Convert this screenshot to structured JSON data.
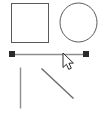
{
  "canvas": {
    "width": 103,
    "height": 115,
    "background_color": "#ffffff",
    "label": "drawing-canvas"
  },
  "style": {
    "shape_stroke_color": "#5a5a5a",
    "line_stroke_color": "#8e8e8e",
    "diagonal_stroke_color": "#6b6b6b",
    "handle_fill_color": "#2b2b2b",
    "handle_stroke_color": "#2b2b2b",
    "cursor_fill_color": "#ffffff",
    "cursor_stroke_color": "#2b2b2b",
    "shape_fill_color": "none",
    "shape_stroke_width": 1,
    "line_stroke_width": 1.4,
    "diagonal_stroke_width": 1.4
  },
  "shapes": [
    {
      "id": "square",
      "type": "rectangle",
      "name": "square-shape",
      "x": 11,
      "y": 3,
      "width": 37,
      "height": 39,
      "selected": false
    },
    {
      "id": "circle",
      "type": "ellipse",
      "name": "circle-shape",
      "cx": 78.5,
      "cy": 22.5,
      "rx": 18.5,
      "ry": 19.5,
      "selected": false
    },
    {
      "id": "horizontal-line",
      "type": "line",
      "name": "horizontal-line-shape",
      "x1": 12,
      "y1": 54,
      "x2": 86,
      "y2": 54,
      "selected": true
    },
    {
      "id": "vertical-line",
      "type": "line",
      "name": "vertical-line-shape",
      "x1": 20,
      "y1": 67,
      "x2": 20,
      "y2": 108,
      "selected": false
    },
    {
      "id": "diagonal-line",
      "type": "line",
      "name": "diagonal-line-shape",
      "x1": 41,
      "y1": 68,
      "x2": 73,
      "y2": 98,
      "selected": false
    }
  ],
  "selection_handles": [
    {
      "name": "selection-handle-left",
      "cx": 12,
      "cy": 54,
      "size": 5
    },
    {
      "name": "selection-handle-right",
      "cx": 86,
      "cy": 54,
      "size": 5
    }
  ],
  "cursor": {
    "name": "arrow-cursor",
    "icon": "mouse-pointer-arrow-icon",
    "x": 63,
    "y": 53
  }
}
